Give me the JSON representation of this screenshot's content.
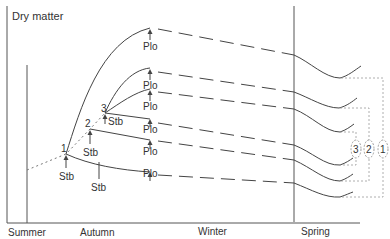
{
  "diagram": {
    "y_axis_label": "Dry matter",
    "seasons": [
      "Summer",
      "Autumn",
      "Winter",
      "Spring"
    ],
    "sowing_points": [
      {
        "number": "1",
        "label": "Stb"
      },
      {
        "number": "2",
        "label": "Stb"
      },
      {
        "number": "3",
        "label": "Stb"
      }
    ],
    "extra_stb_label": "Stb",
    "plo_labels": [
      "Plo",
      "Plo",
      "Plo",
      "Plo",
      "Plo",
      "Plo"
    ],
    "groups": [
      "3",
      "2",
      "1"
    ],
    "colors": {
      "line": "#444444",
      "axis": "#555555",
      "text": "#333333",
      "bracket": "#999999"
    }
  }
}
